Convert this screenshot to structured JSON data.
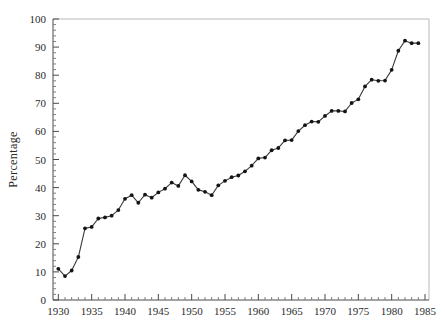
{
  "chart_data": {
    "type": "line",
    "title": "",
    "subtitle": "",
    "xlabel": "",
    "ylabel": "Percentage",
    "xlim": [
      1929.2,
      1985.6
    ],
    "ylim": [
      0,
      100
    ],
    "grid": false,
    "legend": null,
    "x_ticks_major": [
      1930,
      1935,
      1940,
      1945,
      1950,
      1955,
      1960,
      1965,
      1970,
      1975,
      1980,
      1985
    ],
    "x_tick_labels": [
      "1930",
      "1935",
      "1940",
      "1945",
      "1950",
      "1955",
      "1960",
      "1965",
      "1970",
      "1975",
      "1980",
      "1985"
    ],
    "x_minor_tick_step": 1,
    "y_ticks_major": [
      0,
      10,
      20,
      30,
      40,
      50,
      60,
      70,
      80,
      90,
      100
    ],
    "y_tick_labels": [
      "0",
      "10",
      "20",
      "30",
      "40",
      "50",
      "60",
      "70",
      "80",
      "90",
      "100"
    ],
    "y_minor_tick_step": 2,
    "marker": "filled-circle",
    "line_color": "#3a3a3a",
    "marker_color": "#141414",
    "x": [
      1930,
      1931,
      1932,
      1933,
      1934,
      1935,
      1936,
      1937,
      1938,
      1939,
      1940,
      1941,
      1942,
      1943,
      1944,
      1945,
      1946,
      1947,
      1948,
      1949,
      1950,
      1951,
      1952,
      1953,
      1954,
      1955,
      1956,
      1957,
      1958,
      1959,
      1960,
      1961,
      1962,
      1963,
      1964,
      1965,
      1966,
      1967,
      1968,
      1969,
      1970,
      1971,
      1972,
      1973,
      1974,
      1975,
      1976,
      1977,
      1978,
      1979,
      1980,
      1981,
      1982,
      1983,
      1984
    ],
    "y": [
      11.1,
      8.5,
      10.5,
      15.3,
      25.5,
      26.0,
      29.0,
      29.4,
      30.0,
      32.0,
      36.0,
      37.3,
      34.6,
      37.5,
      36.4,
      38.3,
      39.6,
      41.8,
      40.6,
      44.4,
      42.2,
      39.2,
      38.5,
      37.3,
      40.8,
      42.4,
      43.7,
      44.3,
      45.8,
      47.8,
      50.4,
      50.7,
      53.3,
      54.1,
      56.8,
      56.9,
      60.1,
      62.2,
      63.5,
      63.4,
      65.5,
      67.3,
      67.3,
      67.1,
      70.1,
      71.4,
      76.0,
      78.4,
      78.0,
      78.1,
      81.9,
      88.7,
      92.3,
      91.4,
      91.4
    ],
    "series": [
      {
        "name": "Percentage",
        "values": [
          11.1,
          8.5,
          10.5,
          15.3,
          25.5,
          26.0,
          29.0,
          29.4,
          30.0,
          32.0,
          36.0,
          37.3,
          34.6,
          37.5,
          36.4,
          38.3,
          39.6,
          41.8,
          40.6,
          44.4,
          42.2,
          39.2,
          38.5,
          37.3,
          40.8,
          42.4,
          43.7,
          44.3,
          45.8,
          47.8,
          50.4,
          50.7,
          53.3,
          54.1,
          56.8,
          56.9,
          60.1,
          62.2,
          63.5,
          63.4,
          65.5,
          67.3,
          67.3,
          67.1,
          70.1,
          71.4,
          76.0,
          78.4,
          78.0,
          78.1,
          81.9,
          88.7,
          92.3,
          91.4,
          91.4
        ]
      }
    ]
  }
}
